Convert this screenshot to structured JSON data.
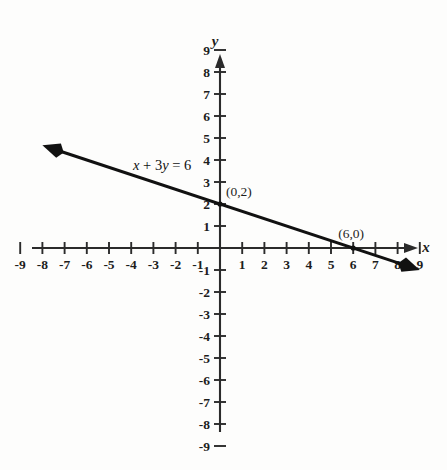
{
  "chart_data": {
    "type": "line",
    "title": "",
    "subtitle": "",
    "equation_label": "x + 3y = 6",
    "equation_parts": {
      "var1": "x",
      "plus": " + ",
      "coef": "3",
      "var2": "y",
      "equals": " = ",
      "rhs": "6"
    },
    "xlabel": "x",
    "ylabel": "y",
    "xlim": [
      -9.8,
      9.8
    ],
    "ylim": [
      -9.8,
      9.8
    ],
    "grid": false,
    "legend": "none",
    "x_ticks": [
      -9,
      -8,
      -7,
      -6,
      -5,
      -4,
      -3,
      -2,
      -1,
      1,
      2,
      3,
      4,
      5,
      6,
      7,
      8,
      9
    ],
    "x_tick_labels": [
      "-9",
      "-8",
      "-7",
      "-6",
      "-5",
      "-4",
      "-3",
      "-2",
      "-1",
      "1",
      "2",
      "3",
      "4",
      "5",
      "6",
      "7",
      "8",
      "9"
    ],
    "y_ticks": [
      9,
      8,
      7,
      6,
      5,
      4,
      3,
      2,
      1,
      -1,
      -2,
      -3,
      -4,
      -5,
      -6,
      -7,
      -8,
      -9
    ],
    "y_tick_labels": [
      "9",
      "8",
      "7",
      "6",
      "5",
      "4",
      "3",
      "2",
      "1",
      "-1",
      "-2",
      "-3",
      "-4",
      "-5",
      "-6",
      "-7",
      "-8",
      "-9"
    ],
    "series": [
      {
        "name": "x + 3y = 6",
        "slope": -0.3333333,
        "intercept": 2,
        "x_start": -8.0,
        "y_start": 4.6667,
        "x_end": 9.0,
        "y_end": -1.0,
        "arrows": "both"
      }
    ],
    "annotated_points": [
      {
        "label": "(0,2)",
        "x": 0,
        "y": 2,
        "label_dx": 6,
        "label_dy": -8
      },
      {
        "label": "(6,0)",
        "x": 6,
        "y": 0,
        "label_dx": -2,
        "label_dy": -10
      }
    ]
  },
  "colors": {
    "background": "#fdfdfc",
    "axis": "#2b2b2b",
    "line": "#111111",
    "text": "#1d1d1d"
  }
}
